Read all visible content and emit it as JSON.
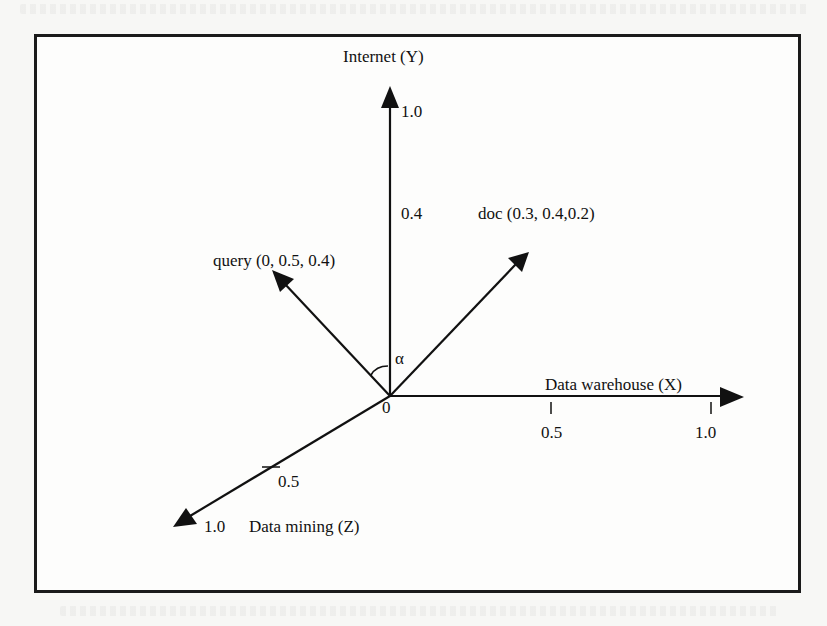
{
  "figure": {
    "type": "vector-space-model",
    "origin_label": "0",
    "angle_label": "α",
    "axes": [
      {
        "id": "y",
        "name": "Internet (Y)",
        "ticks": [
          {
            "label": "1.0"
          },
          {
            "label": "0.4"
          }
        ]
      },
      {
        "id": "x",
        "name": "Data warehouse (X)",
        "ticks": [
          {
            "label": "0.5"
          },
          {
            "label": "1.0"
          }
        ]
      },
      {
        "id": "z",
        "name": "Data mining (Z)",
        "ticks": [
          {
            "label": "0.5"
          },
          {
            "label": "1.0"
          }
        ]
      }
    ],
    "vectors": [
      {
        "id": "query",
        "label": "query (0, 0.5, 0.4)",
        "coords": [
          0,
          0.5,
          0.4
        ]
      },
      {
        "id": "doc",
        "label": "doc (0.3, 0.4,0.2)",
        "coords": [
          0.3,
          0.4,
          0.2
        ]
      }
    ]
  },
  "colors": {
    "ink": "#111111",
    "frame": "#1a1a1a",
    "paper": "#fdfdfc"
  }
}
